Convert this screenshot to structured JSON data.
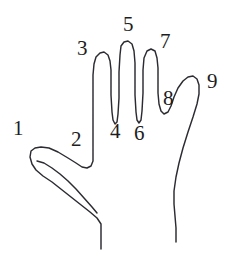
{
  "figure": {
    "width": 235,
    "height": 262,
    "background_color": "#ffffff",
    "stroke_color": "#2b2b31",
    "label_color": "#1d1d22"
  },
  "labels": [
    {
      "id": "landmark-1",
      "text": "1",
      "x": 13,
      "y": 118,
      "anatomy": "thumb-tip"
    },
    {
      "id": "landmark-2",
      "text": "2",
      "x": 71,
      "y": 129,
      "anatomy": "thumb-index-web"
    },
    {
      "id": "landmark-3",
      "text": "3",
      "x": 77,
      "y": 38,
      "anatomy": "index-finger-tip"
    },
    {
      "id": "landmark-4",
      "text": "4",
      "x": 110,
      "y": 121,
      "anatomy": "index-middle-valley"
    },
    {
      "id": "landmark-5",
      "text": "5",
      "x": 123,
      "y": 14,
      "anatomy": "middle-finger-tip"
    },
    {
      "id": "landmark-6",
      "text": "6",
      "x": 134,
      "y": 123,
      "anatomy": "middle-ring-valley"
    },
    {
      "id": "landmark-7",
      "text": "7",
      "x": 160,
      "y": 31,
      "anatomy": "ring-finger-tip"
    },
    {
      "id": "landmark-8",
      "text": "8",
      "x": 163,
      "y": 88,
      "anatomy": "ring-pinky-valley"
    },
    {
      "id": "landmark-9",
      "text": "9",
      "x": 207,
      "y": 71,
      "anatomy": "pinky-finger-tip"
    }
  ],
  "contours": {
    "hand_outline": "M 101 249 L 101 224 L 97 218 L 90 212 L 52 182 L 43 176 L 36 170 L 32 164 L 30 157 L 31 151 L 35 148 L 41 147 L 49 148 L 58 152 L 68 158 L 76 163 L 82 167 L 87 168 L 91 166 L 93 161 L 93 150 L 93 100 L 93 75 L 94 64 L 96 57 L 100 53 L 104 52 L 108 55 L 110 61 L 111 70 L 111 95 L 112 112 L 113 120 L 115 124 L 117 122 L 118 114 L 119 98 L 119 72 L 120 55 L 121 46 L 124 42 L 128 41 L 132 44 L 134 51 L 135 63 L 135 95 L 136 112 L 137 120 L 139 123 L 141 120 L 142 111 L 143 93 L 143 70 L 144 58 L 147 51 L 151 49 L 155 51 L 157 58 L 158 68 L 158 93 L 159 104 L 161 111 L 164 114 L 168 112 L 171 106 L 174 97 L 178 88 L 183 81 L 188 77 L 193 76 L 197 79 L 199 85 L 199 94 L 197 104 L 193 117 L 188 132 L 183 148 L 179 163 L 176 177 L 174 191 L 174 204 L 175 216 L 176 228 L 176 242",
    "thumb_crease": "M 37 161 L 44 163 L 52 168 L 60 174 L 68 181 L 76 189 L 84 198 L 92 207 L 97 213"
  }
}
